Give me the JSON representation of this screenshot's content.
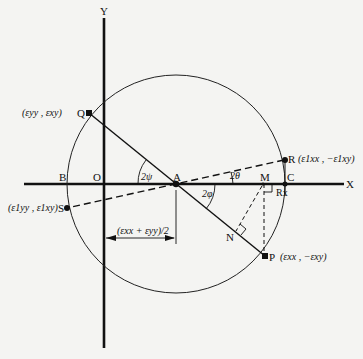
{
  "diagram": {
    "axes": {
      "x_label": "X",
      "y_label": "Y"
    },
    "points": {
      "O": {
        "label": "O"
      },
      "A": {
        "label": "A"
      },
      "B": {
        "label": "B"
      },
      "C": {
        "label": "C"
      },
      "M": {
        "label": "M"
      },
      "N": {
        "label": "N"
      },
      "Q": {
        "label": "Q",
        "coords": "(εyy , εxy)"
      },
      "P": {
        "label": "P",
        "coords": "(εxx , −εxy)"
      },
      "R": {
        "label": "R",
        "coords": "(ε1xx , −ε1xy)"
      },
      "S": {
        "label": "S",
        "coords": "(ε1yy , ε1xy)"
      },
      "Rx": {
        "label": "Rx"
      }
    },
    "angles": {
      "psi": "2ψ",
      "theta": "2θ",
      "phi": "2φ"
    },
    "dimension": "(εxx + εyy)/2",
    "colors": {
      "line": "#111111",
      "background": "#f4f4f2"
    }
  }
}
